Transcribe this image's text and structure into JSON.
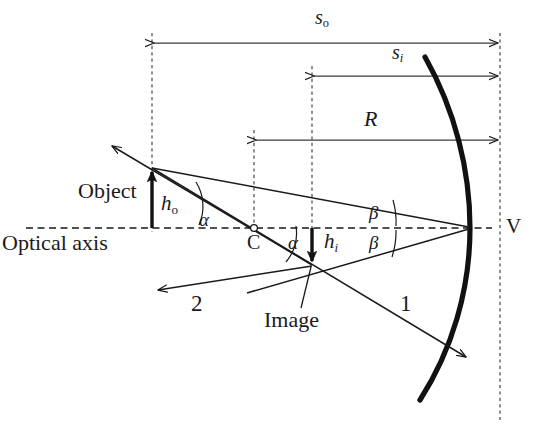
{
  "figure": {
    "kind": "ray-diagram",
    "background_color": "#ffffff",
    "ink_color": "#1a1a1a"
  },
  "labels": {
    "object": "Object",
    "image": "Image",
    "optical_axis": "Optical axis",
    "vertex": "V",
    "center_of_curvature": "C",
    "ray_one": "1",
    "ray_two": "2"
  },
  "symbols": {
    "object_distance": {
      "base": "s",
      "sub": "o"
    },
    "image_distance": {
      "base": "s",
      "sub": "i"
    },
    "radius": {
      "base": "R",
      "sub": ""
    },
    "object_height": {
      "base": "h",
      "sub": "o"
    },
    "image_height": {
      "base": "h",
      "sub": "i"
    },
    "alpha_upper": "α",
    "alpha_lower": "α",
    "beta_upper": "β",
    "beta_lower": "β"
  },
  "dimensions": [
    {
      "name": "s_o",
      "from_x": 152,
      "to_x": 500,
      "y": 43,
      "label": "s",
      "sublabel": "o"
    },
    {
      "name": "s_i",
      "from_x": 312,
      "to_x": 500,
      "y": 76,
      "label": "s",
      "sublabel": "i"
    },
    {
      "name": "R",
      "from_x": 254,
      "to_x": 500,
      "y": 140,
      "label": "R",
      "sublabel": ""
    }
  ],
  "points": {
    "vertex": {
      "x": 470,
      "y": 228
    },
    "center": {
      "x": 254,
      "y": 228
    },
    "object_base": {
      "x": 152,
      "y": 228
    },
    "object_tip": {
      "x": 152,
      "y": 168
    },
    "image_base": {
      "x": 312,
      "y": 228
    },
    "image_tip": {
      "x": 312,
      "y": 265
    }
  },
  "geometry": {
    "axis_y": 228,
    "mirror_dashed_x": 500,
    "mirror_apex_x": 470
  }
}
